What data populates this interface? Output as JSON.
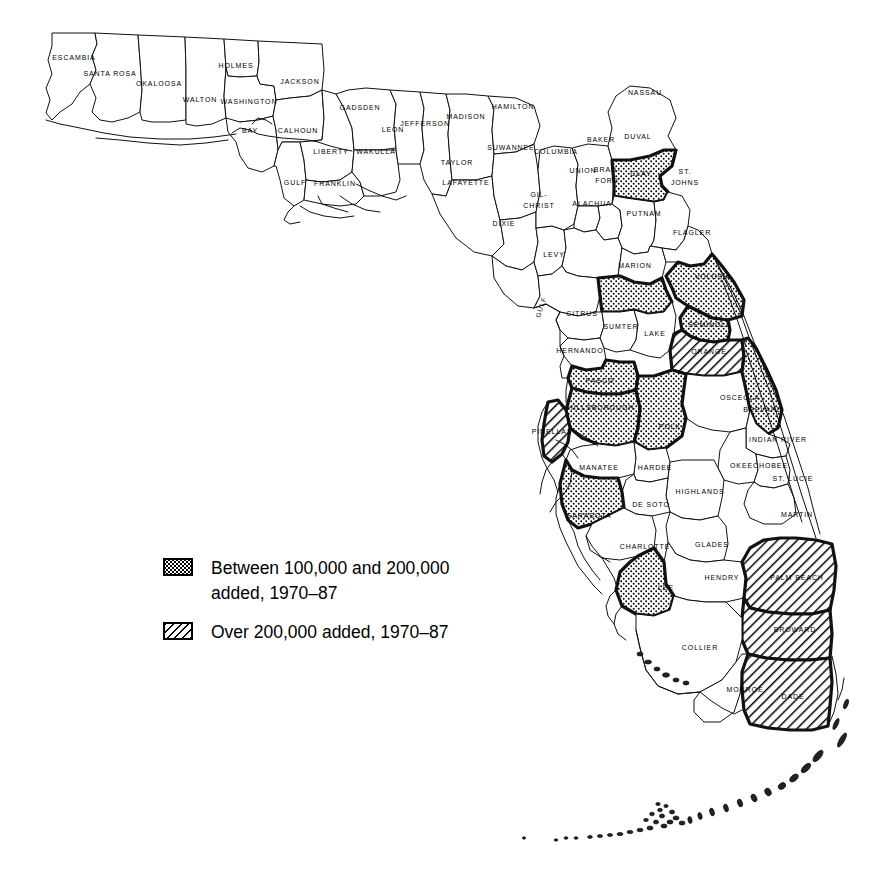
{
  "map": {
    "title": "Florida County Population Growth 1970-1987",
    "state": "Florida",
    "gulf_label": "GULF",
    "colors": {
      "outline": "#111111",
      "fill_plain": "#ffffff",
      "pattern_ink": "#000000",
      "background": "#ffffff"
    }
  },
  "legend": {
    "items": [
      {
        "pattern": "stipple",
        "line1": "Between 100,000 and 200,000",
        "line2": "added, 1970–87",
        "category": "100k-200k"
      },
      {
        "pattern": "hatch",
        "line1": "Over 200,000 added, 1970–87",
        "line2": "",
        "category": "over-200k"
      }
    ]
  },
  "counties": [
    {
      "name": "ESCAMBIA",
      "label": "ESCAMBIA",
      "pattern": "none",
      "lx": 74,
      "ly": 58
    },
    {
      "name": "SANTA ROSA",
      "label": "SANTA ROSA",
      "pattern": "none",
      "lx": 110,
      "ly": 74
    },
    {
      "name": "OKALOOSA",
      "label": "OKALOOSA",
      "pattern": "none",
      "lx": 159,
      "ly": 84
    },
    {
      "name": "WALTON",
      "label": "WALTON",
      "pattern": "none",
      "lx": 200,
      "ly": 100
    },
    {
      "name": "HOLMES",
      "label": "HOLMES",
      "pattern": "none",
      "lx": 236,
      "ly": 66
    },
    {
      "name": "WASHINGTON",
      "label": "WASHINGTON",
      "pattern": "none",
      "lx": 249,
      "ly": 102
    },
    {
      "name": "JACKSON",
      "label": "JACKSON",
      "pattern": "none",
      "lx": 300,
      "ly": 82
    },
    {
      "name": "BAY",
      "label": "BAY",
      "pattern": "none",
      "lx": 250,
      "ly": 131
    },
    {
      "name": "CALHOUN",
      "label": "CALHOUN",
      "pattern": "none",
      "lx": 298,
      "ly": 131
    },
    {
      "name": "GULF",
      "label": "GULF",
      "pattern": "none",
      "lx": 295,
      "ly": 183
    },
    {
      "name": "LIBERTY",
      "label": "LIBERTY",
      "pattern": "none",
      "lx": 331,
      "ly": 152
    },
    {
      "name": "FRANKLIN",
      "label": "FRANKLIN",
      "pattern": "none",
      "lx": 335,
      "ly": 184
    },
    {
      "name": "GADSDEN",
      "label": "GADSDEN",
      "pattern": "none",
      "lx": 360,
      "ly": 108
    },
    {
      "name": "WAKULLA",
      "label": "WAKULLA",
      "pattern": "none",
      "lx": 376,
      "ly": 152
    },
    {
      "name": "LEON",
      "label": "LEON",
      "pattern": "none",
      "lx": 393,
      "ly": 130
    },
    {
      "name": "JEFFERSON",
      "label": "JEFFERSON",
      "pattern": "none",
      "lx": 425,
      "ly": 124
    },
    {
      "name": "MADISON",
      "label": "MADISON",
      "pattern": "none",
      "lx": 466,
      "ly": 117
    },
    {
      "name": "TAYLOR",
      "label": "TAYLOR",
      "pattern": "none",
      "lx": 457,
      "ly": 163
    },
    {
      "name": "HAMILTON",
      "label": "HAMILTON",
      "pattern": "none",
      "lx": 513,
      "ly": 107
    },
    {
      "name": "SUWANNEE",
      "label": "SUWANNEE",
      "pattern": "none",
      "lx": 511,
      "ly": 148
    },
    {
      "name": "LAFAYETTE",
      "label": "LAFAYETTE",
      "pattern": "none",
      "lx": 466,
      "ly": 183
    },
    {
      "name": "DIXIE",
      "label": "DIXIE",
      "pattern": "none",
      "lx": 504,
      "ly": 224
    },
    {
      "name": "GILCHRIST",
      "label": "GIL-",
      "label2": "CHRIST",
      "pattern": "none",
      "lx": 539,
      "ly": 200
    },
    {
      "name": "COLUMBIA",
      "label": "COLUMBIA",
      "pattern": "none",
      "lx": 556,
      "ly": 152
    },
    {
      "name": "BAKER",
      "label": "BAKER",
      "pattern": "none",
      "lx": 601,
      "ly": 140
    },
    {
      "name": "NASSAU",
      "label": "NASSAU",
      "pattern": "none",
      "lx": 645,
      "ly": 93
    },
    {
      "name": "DUVAL",
      "label": "DUVAL",
      "pattern": "stipple",
      "lx": 638,
      "ly": 137
    },
    {
      "name": "UNION",
      "label": "UNION",
      "pattern": "none",
      "lx": 583,
      "ly": 171
    },
    {
      "name": "BRADFORD",
      "label": "BRAD-",
      "label2": "FORD",
      "pattern": "none",
      "lx": 607,
      "ly": 175
    },
    {
      "name": "CLAY",
      "label": "CLAY",
      "pattern": "none",
      "lx": 641,
      "ly": 174
    },
    {
      "name": "ST. JOHNS",
      "label": "ST.",
      "label2": "JOHNS",
      "pattern": "none",
      "lx": 685,
      "ly": 177
    },
    {
      "name": "ALACHUA",
      "label": "ALACHUA",
      "pattern": "none",
      "lx": 592,
      "ly": 204
    },
    {
      "name": "PUTNAM",
      "label": "PUTNAM",
      "pattern": "none",
      "lx": 644,
      "ly": 214
    },
    {
      "name": "FLAGLER",
      "label": "FLAGLER",
      "pattern": "none",
      "lx": 692,
      "ly": 233
    },
    {
      "name": "LEVY",
      "label": "LEVY",
      "pattern": "none",
      "lx": 554,
      "ly": 255
    },
    {
      "name": "MARION",
      "label": "MARION",
      "pattern": "stipple",
      "lx": 635,
      "ly": 266
    },
    {
      "name": "VOLUSIA",
      "label": "VOLUSIA",
      "pattern": "stipple",
      "lx": 713,
      "ly": 277
    },
    {
      "name": "CITRUS",
      "label": "CITRUS",
      "pattern": "none",
      "lx": 582,
      "ly": 314
    },
    {
      "name": "SUMTER",
      "label": "SUMTER",
      "pattern": "none",
      "lx": 621,
      "ly": 327
    },
    {
      "name": "LAKE",
      "label": "LAKE",
      "pattern": "none",
      "lx": 655,
      "ly": 334
    },
    {
      "name": "SEMINOLE",
      "label": "SEMINOLE",
      "pattern": "stipple",
      "lx": 710,
      "ly": 325
    },
    {
      "name": "HERNANDO",
      "label": "HERNANDO",
      "pattern": "none",
      "lx": 580,
      "ly": 351
    },
    {
      "name": "ORANGE",
      "label": "ORANGE",
      "pattern": "hatch",
      "lx": 709,
      "ly": 352
    },
    {
      "name": "PASCO",
      "label": "PASCO",
      "pattern": "stipple",
      "lx": 600,
      "ly": 381
    },
    {
      "name": "BREVARD",
      "label": "BREVARD",
      "pattern": "stipple",
      "lx": 763,
      "ly": 410
    },
    {
      "name": "OSCEOLA",
      "label": "OSCEOLA",
      "pattern": "none",
      "lx": 740,
      "ly": 398
    },
    {
      "name": "HILLSBOROUGH",
      "label": "HILLSBOROUGH",
      "pattern": "stipple",
      "lx": 601,
      "ly": 408
    },
    {
      "name": "PINELLAS",
      "label": "PINELLAS",
      "pattern": "hatch",
      "lx": 552,
      "ly": 432
    },
    {
      "name": "POLK",
      "label": "POLK",
      "pattern": "stipple",
      "lx": 670,
      "ly": 427
    },
    {
      "name": "INDIAN RIVER",
      "label": "INDIAN RIVER",
      "pattern": "none",
      "lx": 778,
      "ly": 440
    },
    {
      "name": "MANATEE",
      "label": "MANATEE",
      "pattern": "none",
      "lx": 599,
      "ly": 468
    },
    {
      "name": "HARDEE",
      "label": "HARDEE",
      "pattern": "none",
      "lx": 655,
      "ly": 468
    },
    {
      "name": "OKEECHOBEE",
      "label": "OKEECHOBEE",
      "pattern": "none",
      "lx": 759,
      "ly": 466
    },
    {
      "name": "ST. LUCIE",
      "label": "ST. LUCIE",
      "pattern": "none",
      "lx": 793,
      "ly": 479
    },
    {
      "name": "HIGHLANDS",
      "label": "HIGHLANDS",
      "pattern": "none",
      "lx": 700,
      "ly": 492
    },
    {
      "name": "DE SOTO",
      "label": "DE SOTO",
      "pattern": "none",
      "lx": 651,
      "ly": 505
    },
    {
      "name": "SARASOTA",
      "label": "SARASOTA",
      "pattern": "stipple",
      "lx": 589,
      "ly": 516
    },
    {
      "name": "MARTIN",
      "label": "MARTIN",
      "pattern": "none",
      "lx": 797,
      "ly": 515
    },
    {
      "name": "CHARLOTTE",
      "label": "CHARLOTTE",
      "pattern": "none",
      "lx": 645,
      "ly": 547
    },
    {
      "name": "GLADES",
      "label": "GLADES",
      "pattern": "none",
      "lx": 712,
      "ly": 545
    },
    {
      "name": "HENDRY",
      "label": "HENDRY",
      "pattern": "none",
      "lx": 722,
      "ly": 578
    },
    {
      "name": "PALM BEACH",
      "label": "PALM BEACH",
      "pattern": "hatch",
      "lx": 797,
      "ly": 578
    },
    {
      "name": "LEE",
      "label": "LEE",
      "pattern": "stipple",
      "lx": 666,
      "ly": 588
    },
    {
      "name": "BROWARD",
      "label": "BROWARD",
      "pattern": "hatch",
      "lx": 795,
      "ly": 630
    },
    {
      "name": "COLLIER",
      "label": "COLLIER",
      "pattern": "none",
      "lx": 700,
      "ly": 648
    },
    {
      "name": "MONROE",
      "label": "MONROE",
      "pattern": "none",
      "lx": 745,
      "ly": 690
    },
    {
      "name": "DADE",
      "label": "DADE",
      "pattern": "hatch",
      "lx": 793,
      "ly": 697
    }
  ],
  "stipple_counties": [
    "DUVAL",
    "MARION",
    "VOLUSIA",
    "SEMINOLE",
    "BREVARD",
    "PASCO",
    "HILLSBOROUGH",
    "POLK",
    "SARASOTA",
    "LEE"
  ],
  "hatch_counties": [
    "ORANGE",
    "PINELLAS",
    "PALM BEACH",
    "BROWARD",
    "DADE"
  ]
}
